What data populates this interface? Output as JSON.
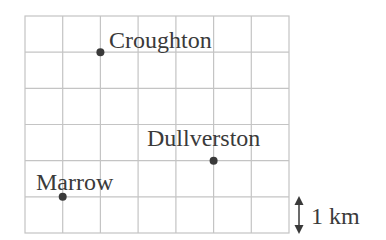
{
  "map": {
    "grid": {
      "columns": 7,
      "rows": 6,
      "cell_km": 1,
      "line_color": "#c4c4c4"
    },
    "places": [
      {
        "name": "Croughton",
        "col": 2,
        "row": 1
      },
      {
        "name": "Dullverston",
        "col": 5,
        "row": 4
      },
      {
        "name": "Marrow",
        "col": 1,
        "row": 5
      }
    ],
    "scale": {
      "label": "1 km"
    },
    "colors": {
      "point": "#3a3a3a",
      "text": "#3a3a3a"
    }
  }
}
